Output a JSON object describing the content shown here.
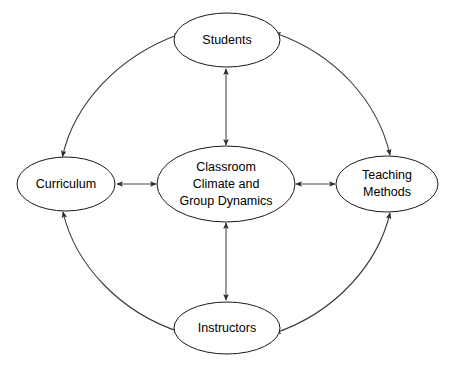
{
  "diagram": {
    "background_color": "#ffffff",
    "node_fill": "#ffffff",
    "node_stroke": "#1a1a1a",
    "arrow_color": "#3a3a3a",
    "nodes": {
      "center": {
        "id": "classroom-climate",
        "line1": "Classroom",
        "line2": "Climate and",
        "line3": "Group Dynamics",
        "cx": 226,
        "cy": 184,
        "rx": 69,
        "ry": 38
      },
      "top": {
        "id": "students",
        "label": "Students",
        "cx": 227,
        "cy": 40,
        "rx": 53,
        "ry": 27
      },
      "left": {
        "id": "curriculum",
        "label": "Curriculum",
        "cx": 66,
        "cy": 184,
        "rx": 49,
        "ry": 27
      },
      "right": {
        "id": "teaching-methods",
        "line1": "Teaching",
        "line2": "Methods",
        "cx": 387,
        "cy": 184,
        "rx": 51,
        "ry": 28
      },
      "bottom": {
        "id": "instructors",
        "label": "Instructors",
        "cx": 227,
        "cy": 328,
        "rx": 53,
        "ry": 26
      }
    },
    "connections": [
      {
        "id": "center-students",
        "from": "classroom-climate",
        "to": "students",
        "style": "straight",
        "arrows": "both"
      },
      {
        "id": "center-curriculum",
        "from": "classroom-climate",
        "to": "curriculum",
        "style": "straight",
        "arrows": "both"
      },
      {
        "id": "center-teaching-methods",
        "from": "classroom-climate",
        "to": "teaching-methods",
        "style": "straight",
        "arrows": "both"
      },
      {
        "id": "center-instructors",
        "from": "classroom-climate",
        "to": "instructors",
        "style": "straight",
        "arrows": "both"
      },
      {
        "id": "curriculum-students",
        "from": "curriculum",
        "to": "students",
        "style": "arc",
        "arrows": "both"
      },
      {
        "id": "students-teaching-methods",
        "from": "students",
        "to": "teaching-methods",
        "style": "arc",
        "arrows": "both"
      },
      {
        "id": "curriculum-instructors",
        "from": "curriculum",
        "to": "instructors",
        "style": "arc",
        "arrows": "both"
      },
      {
        "id": "instructors-teaching-methods",
        "from": "instructors",
        "to": "teaching-methods",
        "style": "arc",
        "arrows": "both"
      }
    ]
  }
}
